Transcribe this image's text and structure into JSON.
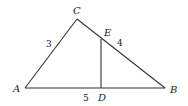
{
  "diagram": {
    "type": "triangle",
    "points": {
      "A": {
        "label": "A"
      },
      "B": {
        "label": "B"
      },
      "C": {
        "label": "C"
      },
      "D": {
        "label": "D"
      },
      "E": {
        "label": "E"
      }
    },
    "segments": [
      {
        "from": "A",
        "to": "C",
        "length_label": "3"
      },
      {
        "from": "C",
        "to": "B"
      },
      {
        "from": "A",
        "to": "B",
        "length_label": "5"
      },
      {
        "from": "D",
        "to": "E"
      }
    ],
    "labels": {
      "AC": "3",
      "EB": "4",
      "AB": "5"
    },
    "colors": {
      "stroke": "#333333",
      "text": "#222222"
    }
  }
}
